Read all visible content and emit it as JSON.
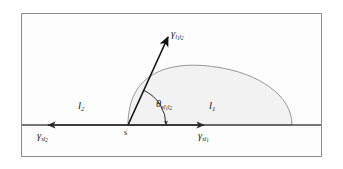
{
  "figure": {
    "type": "contact-angle-wetting-diagram",
    "frame": {
      "x": 21,
      "y": 13,
      "width": 301,
      "height": 144,
      "border_color": "#8c8c8c"
    },
    "colors": {
      "background": "#ffffff",
      "droplet_fill": "#f2f2f2",
      "droplet_stroke": "#8a8a8a",
      "substrate_line": "#4a4a4a",
      "vector_stroke": "#111111",
      "arc_stroke": "#3a3a3a",
      "text": "#1a1a1a"
    },
    "substrate": {
      "y": 125,
      "x_start": 22,
      "x_end": 321
    },
    "droplet": {
      "contact_left_x": 128,
      "contact_right_x": 292,
      "apex_x": 225,
      "apex_y": 68,
      "baseline_y": 125
    },
    "vectors": [
      {
        "name": "interfacial-tension-l1l2",
        "origin_x": 128,
        "origin_y": 125,
        "tip_x": 168,
        "tip_y": 36,
        "direction": "up-right"
      },
      {
        "name": "interfacial-tension-sl2",
        "origin_x": 128,
        "origin_y": 125,
        "tip_x": 47,
        "tip_y": 125,
        "direction": "left"
      },
      {
        "name": "interfacial-tension-sl1",
        "origin_x": 128,
        "origin_y": 125,
        "tip_x": 205,
        "tip_y": 125,
        "direction": "right"
      }
    ],
    "angle_arc": {
      "center_x": 128,
      "center_y": 125,
      "radius": 38,
      "start_angle_deg": 65,
      "end_angle_deg": 0
    }
  },
  "labels": {
    "gamma_l1l2": {
      "symbol": "γ",
      "sub_first": "l",
      "sub_first_index": "1",
      "sub_second": "l",
      "sub_second_index": "2",
      "plain": "γ l1l2"
    },
    "gamma_sl2": {
      "symbol": "γ",
      "sub_first": "s",
      "sub_second": "l",
      "sub_second_index": "2",
      "plain": "γ sl2"
    },
    "gamma_sl1": {
      "symbol": "γ",
      "sub_first": "s",
      "sub_second": "l",
      "sub_second_index": "1",
      "plain": "γ sl1"
    },
    "theta": {
      "symbol": "θ",
      "sub_first": "sl",
      "sub_first_index": "1",
      "sub_second": "l",
      "sub_second_index": "2",
      "plain": "θ sl1l2"
    },
    "region_l1": {
      "symbol": "l",
      "index": "1",
      "plain": "l1"
    },
    "region_l2": {
      "symbol": "l",
      "index": "2",
      "plain": "l2"
    },
    "point_s": {
      "text": "s"
    }
  }
}
